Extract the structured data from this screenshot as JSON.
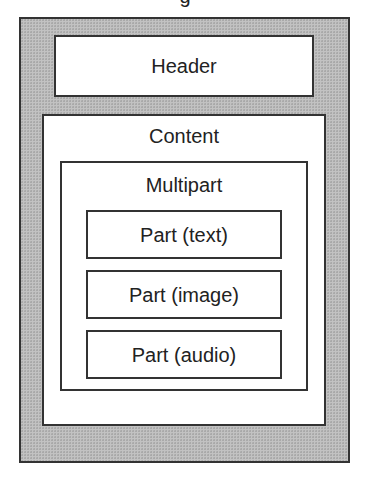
{
  "diagram": {
    "title_fragment": "g",
    "colors": {
      "outer_fill": "#c2c2c2",
      "border": "#333333",
      "inner_fill": "#ffffff",
      "text": "#222222"
    },
    "message": {
      "header": {
        "label": "Header"
      },
      "content": {
        "label": "Content",
        "multipart": {
          "label": "Multipart",
          "parts": [
            {
              "label": "Part (text)"
            },
            {
              "label": "Part (image)"
            },
            {
              "label": "Part (audio)"
            }
          ]
        }
      }
    }
  }
}
